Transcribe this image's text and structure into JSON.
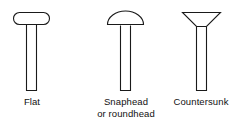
{
  "figure": {
    "background_color": "#ffffff",
    "stroke_color": "#1a1a1a",
    "text_color": "#111111"
  },
  "rivets": [
    {
      "id": "flat",
      "head_type": "flat",
      "head_shape": "stadium",
      "caption_lines": [
        "Flat"
      ],
      "head": {
        "x": 13,
        "y": 12,
        "width": 37,
        "height": 13,
        "corner_radius": 6.5
      },
      "shank": {
        "x": 26,
        "y": 24,
        "width": 11,
        "height": 67
      }
    },
    {
      "id": "snaphead",
      "head_type": "snaphead",
      "head_shape": "dome",
      "caption_lines": [
        "Snaphead",
        "or roundhead"
      ],
      "head": {
        "cx": 126,
        "base_y": 25,
        "radius": 19
      },
      "shank": {
        "x": 120,
        "y": 25,
        "width": 11,
        "height": 66
      }
    },
    {
      "id": "countersunk",
      "head_type": "countersunk",
      "head_shape": "inverted-trapezoid",
      "caption_lines": [
        "Countersunk"
      ],
      "head": {
        "top_left_x": 182,
        "top_right_x": 221,
        "top_y": 12,
        "bottom_left_x": 196,
        "bottom_right_x": 207,
        "bottom_y": 27
      },
      "shank": {
        "x": 196,
        "y": 27,
        "width": 11,
        "height": 64
      }
    }
  ]
}
